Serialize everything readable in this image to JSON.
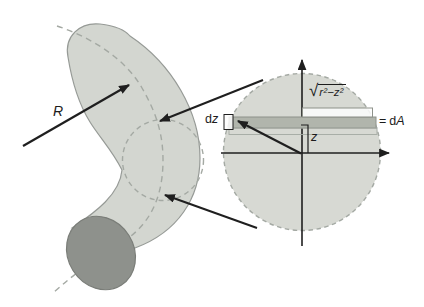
{
  "figure": {
    "type": "textbook-diagram",
    "labels": {
      "R": "R",
      "d": "d",
      "z": "z",
      "A": "A",
      "equals": "=",
      "sqrt_sign": "√",
      "radicand": "r²−z²"
    },
    "colors": {
      "line_color": "#1f1f1f",
      "tube_fill": "#d3d6d0",
      "tube_stroke": "#969a96",
      "dashed_stroke": "#a4a9a3",
      "end_cap_fill": "#8e918c",
      "end_cap_stroke": "#7a7d78",
      "circle_fill": "#d7d9d3",
      "strip_fill": "#b1b5ac",
      "strip_stroke": "#8e928a",
      "bracket_fill": "#fdfdfd"
    }
  }
}
